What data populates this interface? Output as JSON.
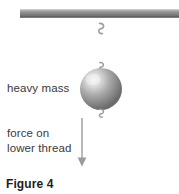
{
  "figure": {
    "caption": "Figure 4",
    "labels": {
      "mass": "heavy mass",
      "force_line1": "force on",
      "force_line2": "lower thread"
    },
    "parts": {
      "ceiling": "ceiling-support-bar",
      "upper_thread": "upper-thread",
      "lower_thread": "lower-thread",
      "mass": "heavy-mass-sphere",
      "upper_hook": "upper-hook",
      "mid_hook": "mid-hook",
      "lower_hook": "lower-hook",
      "force_arrow": "force-arrow"
    },
    "colors": {
      "ceiling_top": "#a8a8a8",
      "ceiling_bottom": "#6b6b6b",
      "thread": "#c4c4c4",
      "sphere_highlight": "#f2f2f2",
      "sphere_mid": "#9a9a9a",
      "sphere_dark": "#5f5f5f",
      "arrow": "#a5a5a5",
      "text": "#3a3a3a",
      "caption_text": "#1d1d1d",
      "background": "#ffffff"
    },
    "geometry": {
      "width": 179,
      "height": 194,
      "thread_x": 101,
      "ceiling_y_top": 10,
      "ceiling_y_bottom": 17,
      "ceiling_x_left": 20,
      "sphere_cx": 101,
      "sphere_cy": 89,
      "sphere_r": 21,
      "arrow_x": 82,
      "arrow_y_top": 118,
      "arrow_y_bottom": 166,
      "lower_thread_y_bottom": 172
    }
  }
}
